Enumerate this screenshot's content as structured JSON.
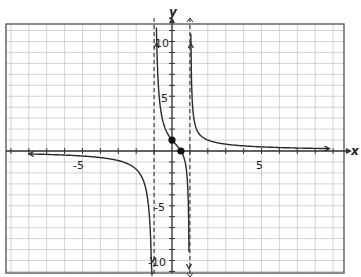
{
  "chart_data": {
    "type": "line",
    "title": "",
    "function": "y = (2x - 1) / (x^2 - 1)",
    "xlabel": "x",
    "ylabel": "y",
    "xlim": [
      -9.3,
      9.6
    ],
    "ylim": [
      -11,
      11.8
    ],
    "x_ticks": [
      {
        "value": -5,
        "label": "-5"
      },
      {
        "value": 5,
        "label": "5"
      }
    ],
    "y_ticks": [
      {
        "value": 10,
        "label": "10"
      },
      {
        "value": 5,
        "label": "5"
      },
      {
        "value": -5,
        "label": "-5"
      },
      {
        "value": -10,
        "label": "-10"
      }
    ],
    "grid": true,
    "vertical_asymptotes": [
      -1,
      1
    ],
    "horizontal_asymptote": 0,
    "marked_points": [
      {
        "x": 0,
        "y": 1
      },
      {
        "x": 0.5,
        "y": 0
      }
    ],
    "branches": [
      {
        "name": "left",
        "x_range": [
          -8,
          -1.08
        ],
        "sample": [
          [
            -8,
            -0.27
          ],
          [
            -5,
            -0.46
          ],
          [
            -3,
            -0.88
          ],
          [
            -2,
            -1.67
          ],
          [
            -1.5,
            -3.2
          ],
          [
            -1.1,
            -15.2
          ]
        ]
      },
      {
        "name": "middle",
        "x_range": [
          -0.87,
          0.95
        ],
        "sample": [
          [
            -0.85,
            9.5
          ],
          [
            -0.5,
            2.67
          ],
          [
            0,
            1
          ],
          [
            0.5,
            0
          ],
          [
            0.8,
            -1.67
          ],
          [
            0.95,
            -9.2
          ]
        ]
      },
      {
        "name": "right",
        "x_range": [
          1.05,
          8.8
        ],
        "sample": [
          [
            1.05,
            10.7
          ],
          [
            1.5,
            1.6
          ],
          [
            2,
            1
          ],
          [
            3,
            0.63
          ],
          [
            5,
            0.38
          ],
          [
            8.8,
            0.22
          ]
        ]
      }
    ]
  },
  "labels": {
    "x_axis": "x",
    "y_axis": "y",
    "x_tick_neg5": "-5",
    "x_tick_5": "5",
    "y_tick_10": "10",
    "y_tick_5": "5",
    "y_tick_neg5": "-5",
    "y_tick_neg10": "-10"
  },
  "colors": {
    "grid": "#c8c8c8",
    "axis": "#333333",
    "curve": "#2a2a2a",
    "frame": "#666666"
  }
}
